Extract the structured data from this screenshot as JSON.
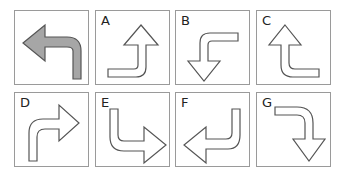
{
  "puzzle": {
    "question": {
      "label": "",
      "description": "Gray arrow going up then turning left"
    },
    "options": [
      {
        "label": "A",
        "description": "Arrow from left going right then turning up"
      },
      {
        "label": "B",
        "description": "Arrow from right going left then turning down"
      },
      {
        "label": "C",
        "description": "Arrow from right going left then turning up"
      },
      {
        "label": "D",
        "description": "Arrow going up then turning right"
      },
      {
        "label": "E",
        "description": "Arrow going down then turning right"
      },
      {
        "label": "F",
        "description": "Arrow going down then turning left"
      },
      {
        "label": "G",
        "description": "Arrow from left going right then turning down"
      }
    ]
  },
  "colors": {
    "question_fill": "#a6a6a6",
    "outline": "#555555",
    "border": "#9a9a9a"
  }
}
